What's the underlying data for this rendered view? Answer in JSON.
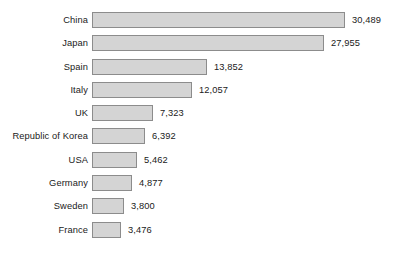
{
  "chart_data": {
    "type": "bar",
    "orientation": "horizontal",
    "title": "",
    "subtitle": "",
    "xlabel": "",
    "ylabel": "",
    "grid": false,
    "legend": null,
    "xlim": [
      0,
      30489
    ],
    "categories": [
      "China",
      "Japan",
      "Spain",
      "Italy",
      "UK",
      "Republic of Korea",
      "USA",
      "Germany",
      "Sweden",
      "France"
    ],
    "values": [
      30489,
      27955,
      13852,
      12057,
      7323,
      6392,
      5462,
      4877,
      3800,
      3476
    ],
    "value_labels": [
      "30,489",
      "27,955",
      "13,852",
      "12,057",
      "7,323",
      "6,392",
      "5,462",
      "4,877",
      "3,800",
      "3,476"
    ],
    "bar_fill_color": "#d4d4d4",
    "bar_border_color": "#8c8c8c",
    "background_color": "#ffffff",
    "text_color": "#1a1a1a"
  },
  "rows": [
    {
      "label": "China",
      "value_label": "30,489",
      "bar_width_px": 253
    },
    {
      "label": "Japan",
      "value_label": "27,955",
      "bar_width_px": 232
    },
    {
      "label": "Spain",
      "value_label": "13,852",
      "bar_width_px": 115
    },
    {
      "label": "Italy",
      "value_label": "12,057",
      "bar_width_px": 100
    },
    {
      "label": "UK",
      "value_label": "7,323",
      "bar_width_px": 61
    },
    {
      "label": "Republic of Korea",
      "value_label": "6,392",
      "bar_width_px": 53
    },
    {
      "label": "USA",
      "value_label": "5,462",
      "bar_width_px": 45
    },
    {
      "label": "Germany",
      "value_label": "4,877",
      "bar_width_px": 40
    },
    {
      "label": "Sweden",
      "value_label": "3,800",
      "bar_width_px": 32
    },
    {
      "label": "France",
      "value_label": "3,476",
      "bar_width_px": 29
    }
  ]
}
